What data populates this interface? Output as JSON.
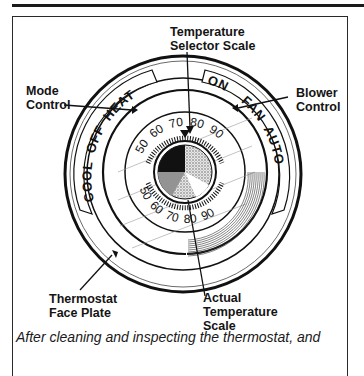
{
  "figure": {
    "labels": {
      "temperature_selector": [
        "Temperature",
        "Selector Scale"
      ],
      "mode_control": [
        "Mode",
        "Control"
      ],
      "blower_control": [
        "Blower",
        "Control"
      ],
      "face_plate": [
        "Thermostat",
        "Face Plate"
      ],
      "actual_temperature": [
        "Actual",
        "Temperature",
        "Scale"
      ]
    },
    "mode_switch": {
      "options": [
        "COOL",
        "OFF",
        "HEAT"
      ]
    },
    "blower_switch": {
      "options": [
        "ON",
        "FAN",
        "AUTO"
      ]
    },
    "selector_scale_ticks": [
      "50",
      "60",
      "70",
      "80",
      "90"
    ],
    "actual_scale_ticks": [
      "50",
      "60",
      "70",
      "80",
      "90"
    ],
    "colors": {
      "ink": "#111111",
      "paper": "#ffffff"
    }
  },
  "caption": "After cleaning and inspecting the thermostat, and"
}
